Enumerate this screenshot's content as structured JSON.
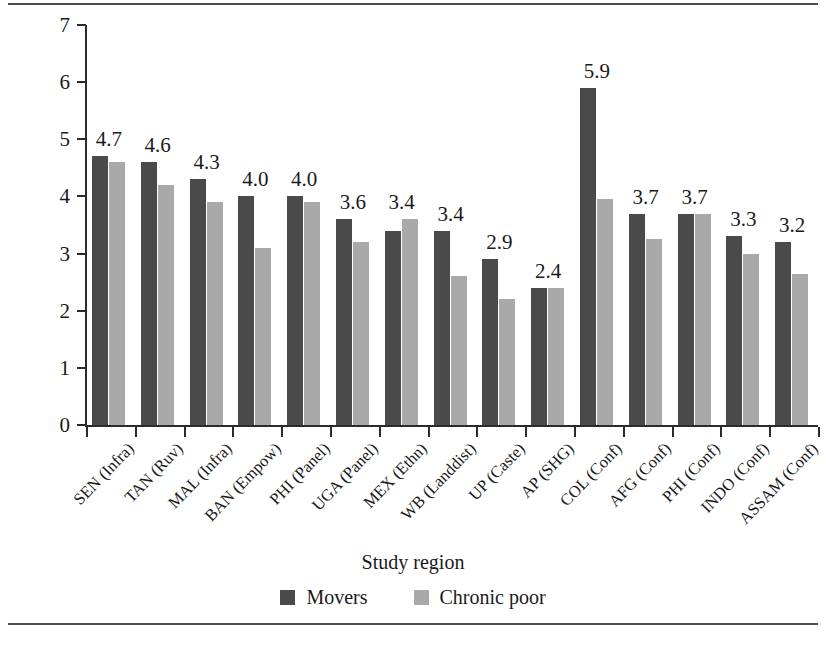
{
  "figure": {
    "has_top_rule": true,
    "has_bottom_rule": true
  },
  "colors": {
    "movers": "#4a4a4a",
    "chronic_poor": "#a9a9a9",
    "axis": "#2b2b2b",
    "rule": "#4d4d4d",
    "background": "#ffffff"
  },
  "chart_data": {
    "type": "bar",
    "title": "",
    "xlabel": "Study region",
    "ylabel": "Average step on ladder of power and rights",
    "ylim": [
      0,
      7
    ],
    "yticks": [
      0,
      1,
      2,
      3,
      4,
      5,
      6,
      7
    ],
    "ytick_labels": [
      "0",
      "1",
      "2",
      "3",
      "4",
      "5",
      "6",
      "7"
    ],
    "grid": false,
    "legend_position": "bottom-center",
    "categories": [
      "SEN (Infra)",
      "TAN (Ruv)",
      "MAL (Infra)",
      "BAN (Empow)",
      "PHI (Panel)",
      "UGA (Panel)",
      "MEX (Ethn)",
      "WB (Landdist)",
      "UP (Caste)",
      "AP (SHG)",
      "COL (Conf)",
      "AFG (Conf)",
      "PHI (Conf)",
      "INDO (Conf)",
      "ASSAM (Conf)"
    ],
    "series": [
      {
        "name": "Movers",
        "color": "#4a4a4a",
        "values": [
          4.7,
          4.6,
          4.3,
          4.0,
          4.0,
          3.6,
          3.4,
          3.4,
          2.9,
          2.4,
          5.9,
          3.7,
          3.7,
          3.3,
          3.2
        ]
      },
      {
        "name": "Chronic poor",
        "color": "#a9a9a9",
        "values": [
          4.6,
          4.2,
          3.9,
          3.1,
          3.9,
          3.2,
          3.6,
          2.6,
          2.2,
          2.4,
          3.95,
          3.25,
          3.7,
          3.0,
          2.65
        ]
      }
    ],
    "annotations": [
      {
        "category": "SEN (Infra)",
        "text": "4.7"
      },
      {
        "category": "TAN (Ruv)",
        "text": "4.6"
      },
      {
        "category": "MAL (Infra)",
        "text": "4.3"
      },
      {
        "category": "BAN (Empow)",
        "text": "4.0"
      },
      {
        "category": "PHI (Panel)",
        "text": "4.0"
      },
      {
        "category": "UGA (Panel)",
        "text": "3.6"
      },
      {
        "category": "MEX (Ethn)",
        "text": "3.4"
      },
      {
        "category": "WB (Landdist)",
        "text": "3.4"
      },
      {
        "category": "UP (Caste)",
        "text": "2.9"
      },
      {
        "category": "AP (SHG)",
        "text": "2.4"
      },
      {
        "category": "COL (Conf)",
        "text": "5.9"
      },
      {
        "category": "AFG (Conf)",
        "text": "3.7"
      },
      {
        "category": "PHI (Conf)",
        "text": "3.7"
      },
      {
        "category": "INDO (Conf)",
        "text": "3.3"
      },
      {
        "category": "ASSAM (Conf)",
        "text": "3.2"
      }
    ]
  },
  "legend": [
    {
      "label": "Movers",
      "color": "#4a4a4a"
    },
    {
      "label": "Chronic poor",
      "color": "#a9a9a9"
    }
  ]
}
